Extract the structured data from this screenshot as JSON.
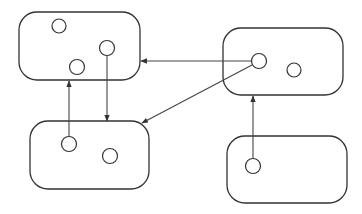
{
  "diagram": {
    "colors": {
      "stroke": "#333333",
      "background": "#ffffff"
    },
    "containers": [
      {
        "id": "top-left",
        "x": 19,
        "y": 12,
        "w": 121,
        "h": 68,
        "r": 18
      },
      {
        "id": "top-right",
        "x": 223,
        "y": 28,
        "w": 120,
        "h": 67,
        "r": 18
      },
      {
        "id": "bottom-left",
        "x": 30,
        "y": 121,
        "w": 119,
        "h": 68,
        "r": 18
      },
      {
        "id": "bottom-right",
        "x": 227,
        "y": 136,
        "w": 120,
        "h": 67,
        "r": 18
      }
    ],
    "nodes": [
      {
        "id": "tl-a",
        "container": "top-left",
        "cx": 59,
        "cy": 26,
        "r": 7
      },
      {
        "id": "tl-b",
        "container": "top-left",
        "cx": 107,
        "cy": 48,
        "r": 7.5
      },
      {
        "id": "tl-c",
        "container": "top-left",
        "cx": 77,
        "cy": 67,
        "r": 7.5
      },
      {
        "id": "tr-a",
        "container": "top-right",
        "cx": 259,
        "cy": 61,
        "r": 7.5
      },
      {
        "id": "tr-b",
        "container": "top-right",
        "cx": 294,
        "cy": 70,
        "r": 7
      },
      {
        "id": "bl-a",
        "container": "bottom-left",
        "cx": 69,
        "cy": 144,
        "r": 7.5
      },
      {
        "id": "bl-b",
        "container": "bottom-left",
        "cx": 110,
        "cy": 156,
        "r": 7.5
      },
      {
        "id": "br-a",
        "container": "bottom-right",
        "cx": 253,
        "cy": 166,
        "r": 7.5
      }
    ],
    "edges": [
      {
        "from": "tr-a",
        "to": "top-left",
        "x1": 251,
        "y1": 61,
        "x2": 141,
        "y2": 61
      },
      {
        "from": "tr-a",
        "to": "bottom-left",
        "x1": 252,
        "y1": 65,
        "x2": 142,
        "y2": 123
      },
      {
        "from": "tl-b",
        "to": "bottom-left",
        "x1": 107,
        "y1": 56,
        "x2": 107,
        "y2": 121
      },
      {
        "from": "bl-a",
        "to": "top-left",
        "x1": 69,
        "y1": 136,
        "x2": 69,
        "y2": 81
      },
      {
        "from": "br-a",
        "to": "top-right",
        "x1": 253,
        "y1": 158,
        "x2": 253,
        "y2": 96
      }
    ]
  }
}
